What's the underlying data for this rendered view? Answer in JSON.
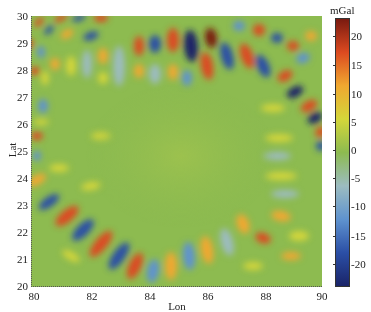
{
  "chart_data": {
    "type": "heatmap",
    "title": "",
    "xlabel": "Lon",
    "ylabel": "Lat",
    "xlim": [
      80,
      90
    ],
    "ylim": [
      20,
      30
    ],
    "x_ticks": [
      "80",
      "82",
      "84",
      "86",
      "88",
      "90"
    ],
    "y_ticks": [
      "30",
      "29",
      "28",
      "27",
      "26",
      "25",
      "24",
      "23",
      "22",
      "21",
      "20"
    ],
    "colorbar": {
      "label": "mGal",
      "range": [
        -23,
        23
      ],
      "ticks": [
        "20",
        "15",
        "10",
        "5",
        "0",
        "-5",
        "-10",
        "-15",
        "-20"
      ],
      "colormap": "jet-like (dark blue → blue → light blue → green → yellow → orange → red → dark red)"
    },
    "grid": false,
    "legend_position": "right colorbar"
  },
  "colors": {
    "background": "#8dbb50",
    "ramp": [
      "#1a2468",
      "#2b4fa6",
      "#5f93cf",
      "#9cbcc0",
      "#8dbb50",
      "#d4d63a",
      "#f0a830",
      "#dc4a20",
      "#7a1a10"
    ]
  },
  "blobs": [
    {
      "x": 8,
      "y": 6,
      "rx": 6,
      "ry": 3,
      "r": -45,
      "c": "#dc4a20"
    },
    {
      "x": 18,
      "y": 14,
      "rx": 6,
      "ry": 3,
      "r": -45,
      "c": "#2b4fa6"
    },
    {
      "x": -2,
      "y": 28,
      "rx": 5,
      "ry": 4,
      "r": -45,
      "c": "#dc4a20"
    },
    {
      "x": 30,
      "y": 2,
      "rx": 7,
      "ry": 3,
      "r": -30,
      "c": "#dc4a20"
    },
    {
      "x": 48,
      "y": 2,
      "rx": 7,
      "ry": 3,
      "r": -20,
      "c": "#2b4fa6"
    },
    {
      "x": 70,
      "y": 2,
      "rx": 7,
      "ry": 4,
      "r": 0,
      "c": "#dc4a20"
    },
    {
      "x": 60,
      "y": 20,
      "rx": 8,
      "ry": 4,
      "r": -20,
      "c": "#2b4fa6"
    },
    {
      "x": 36,
      "y": 18,
      "rx": 7,
      "ry": 4,
      "r": -30,
      "c": "#f0a830"
    },
    {
      "x": 10,
      "y": 36,
      "rx": 4,
      "ry": 6,
      "r": 0,
      "c": "#5f93cf"
    },
    {
      "x": 4,
      "y": 55,
      "rx": 5,
      "ry": 4,
      "r": 0,
      "c": "#dc4a20"
    },
    {
      "x": 14,
      "y": 62,
      "rx": 4,
      "ry": 7,
      "r": 0,
      "c": "#d4d63a"
    },
    {
      "x": 12,
      "y": 90,
      "rx": 5,
      "ry": 7,
      "r": 0,
      "c": "#5f93cf"
    },
    {
      "x": 24,
      "y": 48,
      "rx": 5,
      "ry": 6,
      "r": 0,
      "c": "#f0a830"
    },
    {
      "x": 40,
      "y": 50,
      "rx": 5,
      "ry": 10,
      "r": 0,
      "c": "#d4d63a"
    },
    {
      "x": 56,
      "y": 48,
      "rx": 5,
      "ry": 14,
      "r": 0,
      "c": "#9cbcc0"
    },
    {
      "x": 72,
      "y": 40,
      "rx": 5,
      "ry": 8,
      "r": 0,
      "c": "#f0a830"
    },
    {
      "x": 72,
      "y": 62,
      "rx": 5,
      "ry": 6,
      "r": 0,
      "c": "#d4d63a"
    },
    {
      "x": 88,
      "y": 50,
      "rx": 6,
      "ry": 20,
      "r": 0,
      "c": "#9cbcc0"
    },
    {
      "x": 108,
      "y": 30,
      "rx": 5,
      "ry": 10,
      "r": 0,
      "c": "#dc4a20"
    },
    {
      "x": 108,
      "y": 55,
      "rx": 5,
      "ry": 7,
      "r": 0,
      "c": "#f0a830"
    },
    {
      "x": 124,
      "y": 28,
      "rx": 6,
      "ry": 9,
      "r": 0,
      "c": "#2b4fa6"
    },
    {
      "x": 124,
      "y": 58,
      "rx": 6,
      "ry": 10,
      "r": 0,
      "c": "#9cbcc0"
    },
    {
      "x": 142,
      "y": 24,
      "rx": 6,
      "ry": 12,
      "r": 0,
      "c": "#dc4a20"
    },
    {
      "x": 142,
      "y": 56,
      "rx": 5,
      "ry": 8,
      "r": 0,
      "c": "#f0a830"
    },
    {
      "x": 160,
      "y": 30,
      "rx": 7,
      "ry": 16,
      "r": -5,
      "c": "#1a2468"
    },
    {
      "x": 156,
      "y": 62,
      "rx": 5,
      "ry": 8,
      "r": 0,
      "c": "#5f93cf"
    },
    {
      "x": 180,
      "y": 22,
      "rx": 6,
      "ry": 10,
      "r": -8,
      "c": "#7a1a10"
    },
    {
      "x": 176,
      "y": 50,
      "rx": 6,
      "ry": 14,
      "r": -10,
      "c": "#dc4a20"
    },
    {
      "x": 196,
      "y": 40,
      "rx": 6,
      "ry": 14,
      "r": -15,
      "c": "#2b4fa6"
    },
    {
      "x": 208,
      "y": 10,
      "rx": 6,
      "ry": 5,
      "r": 0,
      "c": "#5f93cf"
    },
    {
      "x": 216,
      "y": 40,
      "rx": 6,
      "ry": 13,
      "r": -20,
      "c": "#dc4a20"
    },
    {
      "x": 228,
      "y": 14,
      "rx": 6,
      "ry": 6,
      "r": 0,
      "c": "#dc4a20"
    },
    {
      "x": 232,
      "y": 50,
      "rx": 6,
      "ry": 12,
      "r": -25,
      "c": "#2b4fa6"
    },
    {
      "x": 246,
      "y": 22,
      "rx": 6,
      "ry": 5,
      "r": 0,
      "c": "#2b4fa6"
    },
    {
      "x": 254,
      "y": 60,
      "rx": 8,
      "ry": 5,
      "r": -30,
      "c": "#dc4a20"
    },
    {
      "x": 262,
      "y": 30,
      "rx": 6,
      "ry": 5,
      "r": 0,
      "c": "#dc4a20"
    },
    {
      "x": 272,
      "y": 42,
      "rx": 7,
      "ry": 5,
      "r": -20,
      "c": "#5f93cf"
    },
    {
      "x": 280,
      "y": 20,
      "rx": 6,
      "ry": 5,
      "r": 0,
      "c": "#f0a830"
    },
    {
      "x": 264,
      "y": 76,
      "rx": 9,
      "ry": 5,
      "r": -30,
      "c": "#1a2468"
    },
    {
      "x": 278,
      "y": 90,
      "rx": 9,
      "ry": 5,
      "r": -30,
      "c": "#dc4a20"
    },
    {
      "x": 284,
      "y": 102,
      "rx": 8,
      "ry": 5,
      "r": -30,
      "c": "#1a2468"
    },
    {
      "x": 290,
      "y": 116,
      "rx": 6,
      "ry": 5,
      "r": -30,
      "c": "#dc4a20"
    },
    {
      "x": 290,
      "y": 130,
      "rx": 5,
      "ry": 5,
      "r": 0,
      "c": "#2b4fa6"
    },
    {
      "x": 242,
      "y": 92,
      "rx": 12,
      "ry": 4,
      "r": 0,
      "c": "#d4d63a"
    },
    {
      "x": 248,
      "y": 122,
      "rx": 14,
      "ry": 4,
      "r": 0,
      "c": "#d4d63a"
    },
    {
      "x": 246,
      "y": 140,
      "rx": 14,
      "ry": 4,
      "r": 0,
      "c": "#9cbcc0"
    },
    {
      "x": 250,
      "y": 160,
      "rx": 16,
      "ry": 4,
      "r": 0,
      "c": "#d4d63a"
    },
    {
      "x": 254,
      "y": 178,
      "rx": 14,
      "ry": 4,
      "r": 0,
      "c": "#9cbcc0"
    },
    {
      "x": 250,
      "y": 200,
      "rx": 10,
      "ry": 5,
      "r": 10,
      "c": "#f0a830"
    },
    {
      "x": 268,
      "y": 220,
      "rx": 10,
      "ry": 5,
      "r": 0,
      "c": "#d4d63a"
    },
    {
      "x": 232,
      "y": 222,
      "rx": 8,
      "ry": 5,
      "r": 20,
      "c": "#dc4a20"
    },
    {
      "x": 260,
      "y": 240,
      "rx": 10,
      "ry": 4,
      "r": 0,
      "c": "#f0a830"
    },
    {
      "x": 222,
      "y": 250,
      "rx": 10,
      "ry": 4,
      "r": 0,
      "c": "#d4d63a"
    },
    {
      "x": 212,
      "y": 208,
      "rx": 6,
      "ry": 10,
      "r": -20,
      "c": "#f0a830"
    },
    {
      "x": 196,
      "y": 226,
      "rx": 6,
      "ry": 14,
      "r": -15,
      "c": "#9cbcc0"
    },
    {
      "x": 176,
      "y": 234,
      "rx": 6,
      "ry": 14,
      "r": -10,
      "c": "#f0a830"
    },
    {
      "x": 158,
      "y": 240,
      "rx": 6,
      "ry": 14,
      "r": -5,
      "c": "#5f93cf"
    },
    {
      "x": 140,
      "y": 250,
      "rx": 6,
      "ry": 14,
      "r": 0,
      "c": "#f0a830"
    },
    {
      "x": 122,
      "y": 255,
      "rx": 6,
      "ry": 12,
      "r": 10,
      "c": "#5f93cf"
    },
    {
      "x": 104,
      "y": 250,
      "rx": 6,
      "ry": 14,
      "r": 25,
      "c": "#dc4a20"
    },
    {
      "x": 88,
      "y": 240,
      "rx": 6,
      "ry": 16,
      "r": 35,
      "c": "#2b4fa6"
    },
    {
      "x": 70,
      "y": 228,
      "rx": 6,
      "ry": 16,
      "r": 40,
      "c": "#dc4a20"
    },
    {
      "x": 52,
      "y": 214,
      "rx": 6,
      "ry": 14,
      "r": 45,
      "c": "#2b4fa6"
    },
    {
      "x": 36,
      "y": 200,
      "rx": 6,
      "ry": 14,
      "r": 50,
      "c": "#dc4a20"
    },
    {
      "x": 18,
      "y": 186,
      "rx": 5,
      "ry": 12,
      "r": 55,
      "c": "#2b4fa6"
    },
    {
      "x": 6,
      "y": 164,
      "rx": 5,
      "ry": 10,
      "r": 60,
      "c": "#f0a830"
    },
    {
      "x": 6,
      "y": 140,
      "rx": 4,
      "ry": 5,
      "r": 0,
      "c": "#5f93cf"
    },
    {
      "x": 6,
      "y": 120,
      "rx": 6,
      "ry": 4,
      "r": 0,
      "c": "#dc4a20"
    },
    {
      "x": 10,
      "y": 106,
      "rx": 8,
      "ry": 3,
      "r": 0,
      "c": "#d4d63a"
    },
    {
      "x": 28,
      "y": 152,
      "rx": 10,
      "ry": 4,
      "r": 0,
      "c": "#d4d63a"
    },
    {
      "x": 60,
      "y": 170,
      "rx": 10,
      "ry": 4,
      "r": -10,
      "c": "#d4d63a"
    },
    {
      "x": 70,
      "y": 120,
      "rx": 10,
      "ry": 4,
      "r": 0,
      "c": "#d4d63a"
    },
    {
      "x": 40,
      "y": 240,
      "rx": 10,
      "ry": 4,
      "r": 30,
      "c": "#d4d63a"
    }
  ]
}
